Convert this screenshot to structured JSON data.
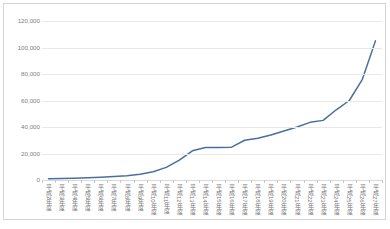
{
  "chart_data": {
    "type": "line",
    "title": "",
    "xlabel": "",
    "ylabel": "",
    "ylim": [
      0,
      120000
    ],
    "ytick_labels": [
      "120,000",
      "100,000",
      "80,000",
      "60,000",
      "40,000",
      "20,000",
      "0"
    ],
    "ytick_values": [
      120000,
      100000,
      80000,
      60000,
      40000,
      20000,
      0
    ],
    "grid": true,
    "legend": "none",
    "line_color": "#4a6f9c",
    "categories": [
      "平成2年度",
      "平成3年度",
      "平成4年度",
      "平成5年度",
      "平成6年度",
      "平成7年度",
      "平成8年度",
      "平成9年度",
      "平成10年度",
      "平成11年度",
      "平成12年度",
      "平成13年度",
      "平成14年度",
      "平成15年度",
      "平成16年度",
      "平成17年度",
      "平成18年度",
      "平成19年度",
      "平成20年度",
      "平成21年度",
      "平成22年度",
      "平成23年度",
      "平成24年度",
      "平成25年度",
      "平成26年度",
      "平成27年度"
    ],
    "values": [
      900,
      1100,
      1400,
      1700,
      2100,
      2600,
      3300,
      4400,
      6200,
      9500,
      15000,
      22000,
      24500,
      24500,
      24800,
      30000,
      31500,
      34000,
      37000,
      40000,
      43500,
      45000,
      53000,
      60000,
      76000,
      105000
    ]
  }
}
